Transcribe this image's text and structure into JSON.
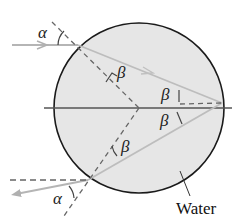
{
  "diagram": {
    "labels": {
      "alpha_in": "α",
      "alpha_out": "α",
      "beta_1": "β",
      "beta_2": "β",
      "beta_3": "β",
      "beta_4": "β",
      "material": "Water"
    },
    "colors": {
      "droplet_fill": "#e6e6e6",
      "droplet_outline": "#1a1a1a",
      "ray": "#b5b5b5",
      "dashed": "#666666",
      "axis": "#555555"
    }
  }
}
